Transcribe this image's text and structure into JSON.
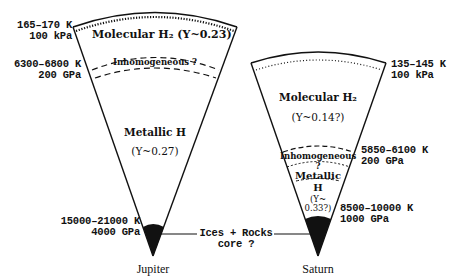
{
  "diagram": {
    "jupiter": {
      "name": "Jupiter",
      "boundaries": [
        {
          "temperature": "165–170 K",
          "pressure": "100 kPa"
        },
        {
          "temperature": "6300–6800 K",
          "pressure": "200 GPa"
        },
        {
          "temperature": "15000–21000 K",
          "pressure": "4000 GPa"
        }
      ],
      "layers": {
        "molecular": "Molecular H₂ (Y~0.23)",
        "inhomogeneous": "Inhomogeneous ?",
        "metallic": "Metallic H",
        "metallic_y": "(Y~0.27)"
      }
    },
    "saturn": {
      "name": "Saturn",
      "boundaries": [
        {
          "temperature": "135–145 K",
          "pressure": "100 kPa"
        },
        {
          "temperature": "5850–6100 K",
          "pressure": "200 GPa"
        },
        {
          "temperature": "8500–10000 K",
          "pressure": "1000 GPa"
        }
      ],
      "layers": {
        "molecular": "Molecular H₂",
        "molecular_y": "(Y~0.14?)",
        "inhomogeneous": "Inhomogeneous",
        "inhomogeneous_q": "?",
        "metallic": "Metallic",
        "metallic_h": "H",
        "metallic_y1": "(Y~",
        "metallic_y2": "0.33?)"
      }
    },
    "core_label": {
      "line1": "Ices + Rocks",
      "line2": "core ?"
    }
  }
}
